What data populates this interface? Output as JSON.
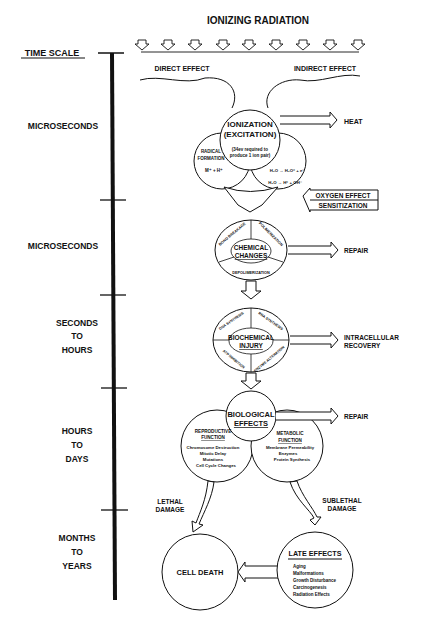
{
  "title": "IONIZING RADIATION",
  "time_scale": {
    "label": "TIME SCALE",
    "stages": [
      {
        "lines": [
          "MICROSECONDS"
        ]
      },
      {
        "lines": [
          "MICROSECONDS"
        ]
      },
      {
        "lines": [
          "SECONDS",
          "TO",
          "HOURS"
        ]
      },
      {
        "lines": [
          "HOURS",
          "TO",
          "DAYS"
        ]
      },
      {
        "lines": [
          "MONTHS",
          "TO",
          "YEARS"
        ]
      }
    ]
  },
  "effects": {
    "direct": "DIRECT EFFECT",
    "indirect": "INDIRECT EFFECT"
  },
  "ionization": {
    "title1": "IONIZATION",
    "title2": "(EXCITATION)",
    "note1": "(34ev required to",
    "note2": "produce 1 ion pair)",
    "radical1": "RADICAL",
    "radical2": "FORMATION",
    "radical_formula": "M⁺ + H⁺",
    "water1": "H₂O → H₂O⁺ + e⁻",
    "water2": "H₂O → H⁺ + OH⁻"
  },
  "outputs": {
    "heat": "HEAT",
    "oxygen1": "OXYGEN EFFECT",
    "oxygen2": "SENSITIZATION",
    "repair1": "REPAIR",
    "intracellular1": "INTRACELLULAR",
    "intracellular2": "RECOVERY",
    "repair2": "REPAIR"
  },
  "chemical": {
    "title1": "CHEMICAL",
    "title2": "CHANGES",
    "bond": "BOND BREAKAGE",
    "poly": "POLIMERIZATION",
    "depoly": "DEPOLIMERIZATION"
  },
  "biochemical": {
    "title1": "BIOCHEMICAL",
    "title2": "INJURY",
    "dna": "DNA SYNTHESIS",
    "rna": "RNA SYNTHESIS",
    "atp": "ATP INHIBITION",
    "enzyme": "ENZYME ALTERATION"
  },
  "biological": {
    "title1": "BIOLOGICAL",
    "title2": "EFFECTS",
    "repro_title1": "REPRODUCTIVE",
    "repro_title2": "FUNCTION",
    "repro_items": [
      "Chromosome Destruction",
      "Mitotic Delay",
      "Mutations",
      "Cell Cycle Changes"
    ],
    "meta_title1": "METABOLIC",
    "meta_title2": "FUNCTION",
    "meta_items": [
      "Membrane Permeability",
      "Enzymes",
      "Protein Synthesis"
    ]
  },
  "damage": {
    "lethal1": "LETHAL",
    "lethal2": "DAMAGE",
    "sublethal1": "SUBLETHAL",
    "sublethal2": "DAMAGE"
  },
  "cell_death": "CELL DEATH",
  "late_effects": {
    "title": "LATE EFFECTS",
    "items": [
      "Aging",
      "Malformations",
      "Growth Disturbance",
      "Carcinogenesis",
      "Radiation Effects"
    ]
  },
  "colors": {
    "ink": "#111111",
    "background": "#ffffff"
  }
}
